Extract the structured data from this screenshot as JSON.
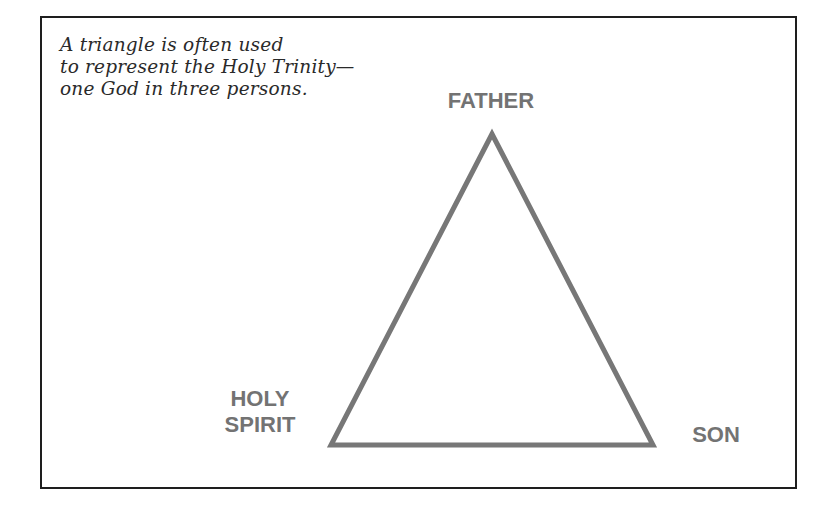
{
  "caption": {
    "lines": [
      "A triangle is often used",
      "to represent the Holy Trinity—",
      "one God in three persons."
    ]
  },
  "triangle": {
    "stroke_color": "#777777",
    "vertices": {
      "top": {
        "label": "FATHER"
      },
      "bottom_left": {
        "label_lines": [
          "HOLY",
          "SPIRIT"
        ]
      },
      "bottom_right": {
        "label": "SON"
      }
    }
  },
  "colors": {
    "frame_border": "#1e1e1e",
    "caption_text": "#2a2a2a",
    "label_text": "#737373"
  }
}
